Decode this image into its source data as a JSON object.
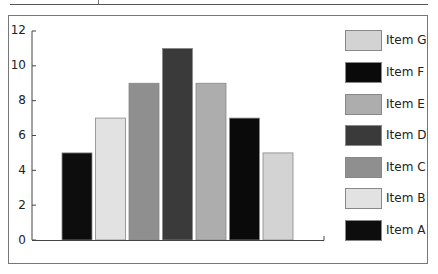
{
  "chart_data": {
    "type": "bar",
    "title": "",
    "xlabel": "",
    "ylabel": "",
    "categories": [
      "Item A",
      "Item B",
      "Item C",
      "Item D",
      "Item E",
      "Item F",
      "Item G"
    ],
    "values": [
      5,
      7,
      9,
      11,
      9,
      7,
      5
    ],
    "colors": [
      "#0d0d0d",
      "#e2e2e2",
      "#8f8f8f",
      "#3a3a3a",
      "#adadad",
      "#0a0a0a",
      "#d3d3d3"
    ],
    "ylim": [
      0,
      12
    ],
    "yticks": [
      0,
      2,
      4,
      6,
      8,
      10,
      12
    ],
    "grid": false,
    "legend_position": "right",
    "legend_order": [
      "Item G",
      "Item F",
      "Item E",
      "Item D",
      "Item C",
      "Item B",
      "Item A"
    ]
  },
  "axis": {
    "ytick_labels": [
      "0",
      "2",
      "4",
      "6",
      "8",
      "10",
      "12"
    ]
  },
  "legend": {
    "items": [
      {
        "label": "Item G",
        "color": "#d3d3d3"
      },
      {
        "label": "Item F",
        "color": "#0a0a0a"
      },
      {
        "label": "Item E",
        "color": "#adadad"
      },
      {
        "label": "Item D",
        "color": "#3a3a3a"
      },
      {
        "label": "Item C",
        "color": "#8f8f8f"
      },
      {
        "label": "Item B",
        "color": "#e2e2e2"
      },
      {
        "label": "Item A",
        "color": "#0d0d0d"
      }
    ]
  }
}
